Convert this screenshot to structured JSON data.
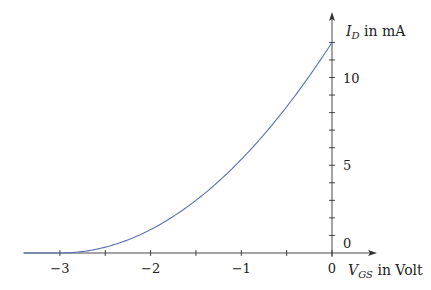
{
  "chart_data": {
    "type": "line",
    "title": "",
    "xlabel": "V_GS in Volt",
    "ylabel": "I_D in mA",
    "x_label_main": "V",
    "x_label_sub": "GS",
    "x_label_rest": " in Volt",
    "y_label_main": "I",
    "y_label_sub": "D",
    "y_label_rest": " in mA",
    "xlim": [
      -3.4,
      0.45
    ],
    "ylim": [
      0,
      13.5
    ],
    "x_ticks": [
      -3,
      -2.5,
      -2,
      -1.5,
      -1,
      -0.5,
      0
    ],
    "x_tick_labels": [
      "-3",
      "-2",
      "-1",
      "0"
    ],
    "x_tick_label_values": [
      -3,
      -2,
      -1,
      0
    ],
    "y_ticks": [
      1,
      2,
      3,
      4,
      5,
      6,
      7,
      8,
      9,
      10,
      11,
      12
    ],
    "y_tick_labels": [
      "0",
      "5",
      "10"
    ],
    "y_tick_label_values": [
      0,
      5,
      10
    ],
    "grid": false,
    "series": [
      {
        "name": "I_D = 12·(1 − V_GS/(−3))²",
        "color": "#5a72b5",
        "x": [
          -3.4,
          -3.0,
          -2.75,
          -2.5,
          -2.25,
          -2.0,
          -1.75,
          -1.5,
          -1.25,
          -1.0,
          -0.75,
          -0.5,
          -0.25,
          0
        ],
        "values": [
          0,
          0,
          0.08,
          0.33,
          0.75,
          1.33,
          2.08,
          3.0,
          4.08,
          5.33,
          6.75,
          8.33,
          10.08,
          12.0
        ]
      }
    ],
    "I_DSS_mA": 12,
    "V_P_volt": -3
  }
}
